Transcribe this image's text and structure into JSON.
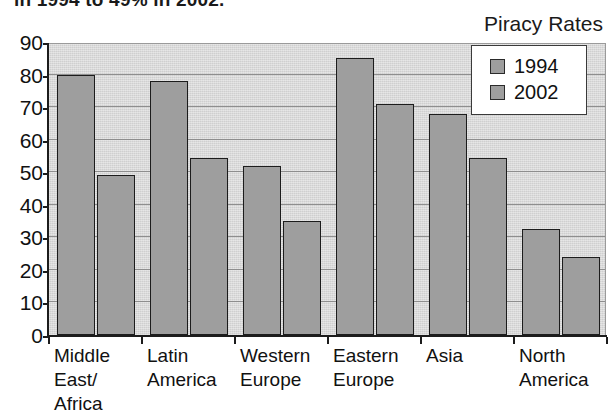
{
  "caption": {
    "clipped_line": "in 1994 to 49% in 2002."
  },
  "chart_title": "Piracy Rates",
  "legend": {
    "position": "top-right",
    "entries": [
      {
        "label": "1994",
        "color": "#9e9e9e"
      },
      {
        "label": "2002",
        "color": "#9e9e9e"
      }
    ]
  },
  "y_axis": {
    "ticks": [
      "90",
      "80",
      "70",
      "60",
      "50",
      "40",
      "30",
      "20",
      "10",
      "0"
    ]
  },
  "x_axis": {
    "categories": [
      "Middle\nEast/\nAfrica",
      "Latin\nAmerica",
      "Western\nEurope",
      "Eastern\nEurope",
      "Asia",
      "North\nAmerica"
    ]
  },
  "chart_data": {
    "type": "bar",
    "title": "Piracy Rates",
    "xlabel": "",
    "ylabel": "",
    "ylim": [
      0,
      90
    ],
    "ytick_step": 10,
    "grid": true,
    "legend_position": "top-right",
    "categories": [
      "Middle East/Africa",
      "Latin America",
      "Western Europe",
      "Eastern Europe",
      "Asia",
      "North America"
    ],
    "series": [
      {
        "name": "1994",
        "values": [
          80,
          78,
          52,
          85,
          68,
          32.5
        ]
      },
      {
        "name": "2002",
        "values": [
          49,
          54.5,
          35,
          71,
          54.5,
          24
        ]
      }
    ]
  },
  "style": {
    "plot_background": "#cfcfcf",
    "bar_fill": "#9e9e9e",
    "bar_outline": "#1c1c1c",
    "axis_color": "#1c1c1c",
    "gridline_color": "#8e8e8e",
    "legend_background": "#ffffff"
  }
}
